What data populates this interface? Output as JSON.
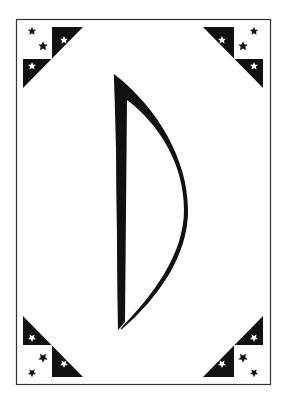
{
  "card": {
    "type": "playing-card",
    "symbol": "bow",
    "colors": {
      "background": "#ffffff",
      "ink": "#111111",
      "border": "#333333"
    },
    "corners": [
      {
        "position": "top-left",
        "stars_black": 2,
        "stars_white": 2
      },
      {
        "position": "top-right",
        "stars_black": 2,
        "stars_white": 2
      },
      {
        "position": "bottom-left",
        "stars_black": 2,
        "stars_white": 2
      },
      {
        "position": "bottom-right",
        "stars_black": 2,
        "stars_white": 2
      }
    ]
  }
}
